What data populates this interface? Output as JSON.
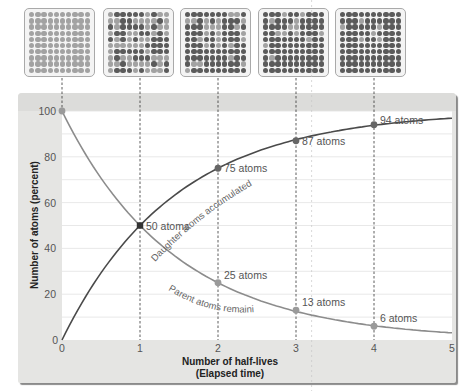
{
  "chart_data": {
    "type": "line",
    "title": "",
    "xlabel": "Number of half-lives (Elapsed time)",
    "xlabel_lines": [
      "Number of half-lives",
      "(Elapsed time)"
    ],
    "ylabel": "Number of atoms (percent)",
    "x": [
      0,
      1,
      2,
      3,
      4,
      5
    ],
    "xlim": [
      0,
      5
    ],
    "ylim": [
      0,
      100
    ],
    "x_ticks": [
      "0",
      "1",
      "2",
      "3",
      "4",
      "5"
    ],
    "y_ticks": [
      "0",
      "20",
      "40",
      "60",
      "80",
      "100"
    ],
    "grid": true,
    "series": [
      {
        "name": "Parent atoms remaining",
        "values": [
          100,
          50,
          25,
          12.5,
          6.25,
          3.125
        ],
        "marked_points": [
          {
            "x": 0,
            "y": 100,
            "label": ""
          },
          {
            "x": 1,
            "y": 50,
            "label": "50 atoms"
          },
          {
            "x": 2,
            "y": 25,
            "label": "25 atoms"
          },
          {
            "x": 3,
            "y": 13,
            "label": "13 atoms"
          },
          {
            "x": 4,
            "y": 6,
            "label": "6 atoms"
          }
        ]
      },
      {
        "name": "Daughter atoms accumulated",
        "values": [
          0,
          50,
          75,
          87.5,
          93.75,
          96.875
        ],
        "marked_points": [
          {
            "x": 1,
            "y": 50,
            "label": "50 atoms"
          },
          {
            "x": 2,
            "y": 75,
            "label": "75 atoms"
          },
          {
            "x": 3,
            "y": 87,
            "label": "87 atoms"
          },
          {
            "x": 4,
            "y": 94,
            "label": "94 atoms"
          }
        ]
      }
    ],
    "annotations": [
      "50 atoms",
      "75 atoms",
      "87 atoms",
      "94 atoms",
      "25 atoms",
      "13 atoms",
      "6 atoms",
      "Daughter atoms accumulated",
      "Parent atoms remaining"
    ]
  },
  "atom_grids": [
    {
      "half_lives": 0,
      "parent": 100,
      "daughter": 0
    },
    {
      "half_lives": 1,
      "parent": 50,
      "daughter": 50
    },
    {
      "half_lives": 2,
      "parent": 25,
      "daughter": 75
    },
    {
      "half_lives": 3,
      "parent": 13,
      "daughter": 87
    },
    {
      "half_lives": 4,
      "parent": 6,
      "daughter": 94
    }
  ],
  "colors": {
    "parent_curve": "#8c8c8c",
    "daughter_curve": "#4a4a4a",
    "panel_bg": "#e5e5e3",
    "plot_bg": "#ffffff"
  }
}
